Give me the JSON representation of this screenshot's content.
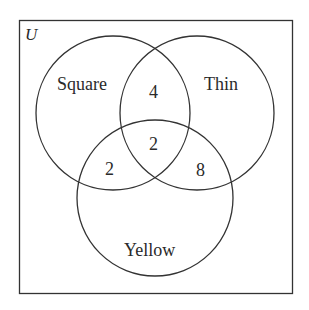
{
  "diagram": {
    "type": "venn",
    "universe_label": "U",
    "sets": [
      {
        "name": "Square",
        "label": "Square"
      },
      {
        "name": "Thin",
        "label": "Thin"
      },
      {
        "name": "Yellow",
        "label": "Yellow"
      }
    ],
    "regions": {
      "square_and_thin_only": "4",
      "all_three": "2",
      "square_and_yellow_only": "2",
      "thin_and_yellow_only": "8"
    },
    "colors": {
      "stroke": "#333333",
      "text": "#2a2a2a",
      "background": "#ffffff"
    }
  }
}
